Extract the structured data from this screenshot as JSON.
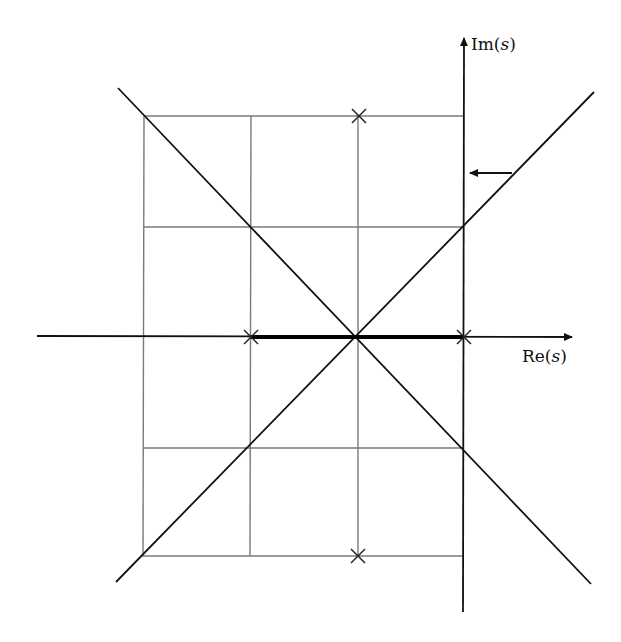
{
  "diagram": {
    "type": "root-locus",
    "axes": {
      "real_label": "Re(",
      "real_var": "s",
      "real_close": ")",
      "imag_label": "Im(",
      "imag_var": "s",
      "imag_close": ")"
    },
    "grid": {
      "x_lines": [
        144,
        251,
        358,
        464
      ],
      "y_lines": [
        116,
        227,
        337,
        448,
        556
      ]
    },
    "poles": [
      {
        "name": "pole-top",
        "x": 359,
        "y": 116
      },
      {
        "name": "pole-bottom",
        "x": 358,
        "y": 556
      },
      {
        "name": "pole-left-real",
        "x": 251,
        "y": 337
      },
      {
        "name": "pole-origin-real",
        "x": 464,
        "y": 337
      }
    ],
    "real_axis_locus": {
      "from_x": 251,
      "to_x": 464,
      "y": 337
    },
    "asymptotes": [
      {
        "name": "asymptote-nw-se",
        "x1": 118,
        "y1": 88,
        "x2": 591,
        "y2": 584
      },
      {
        "name": "asymptote-sw-ne",
        "x1": 116,
        "y1": 582,
        "x2": 594,
        "y2": 92
      }
    ],
    "annotation_arrow": {
      "from_x": 512,
      "to_x": 466,
      "y": 173
    },
    "colors": {
      "axis": "#111111",
      "grid": "#7a7a7a",
      "locus": "#000000",
      "background": "#ffffff"
    }
  }
}
